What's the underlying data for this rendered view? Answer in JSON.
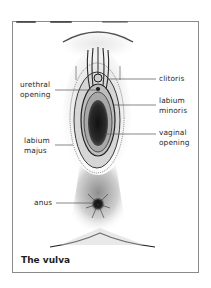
{
  "figure": {
    "caption": "The vulva",
    "labels": {
      "clitoris": "clitoris",
      "urethral_opening": [
        "urethral",
        "opening"
      ],
      "labium_minoris": [
        "labium",
        "minoris"
      ],
      "vaginal_opening": [
        "vaginal",
        "opening"
      ],
      "labium_majus": [
        "labium",
        "majus"
      ],
      "anus": "anus"
    },
    "colors": {
      "ink": "#1e1e1e",
      "frame": "#8a8a8a",
      "leader": "#555555",
      "background": "#ffffff"
    }
  }
}
